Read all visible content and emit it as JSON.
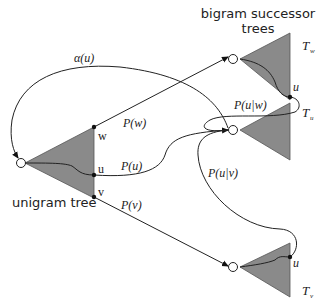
{
  "diagram": {
    "labels": {
      "unigram_tree": "unigram tree",
      "bigram_title_line1": "bigram successor",
      "bigram_title_line2": "trees",
      "alpha": "α(u)",
      "p_w": "P(w)",
      "p_u": "P(u)",
      "p_v": "P(v)",
      "p_u_given_w": "P(u|w)",
      "p_u_given_v": "P(u|v)",
      "leaf_w": "w",
      "leaf_u": "u",
      "leaf_v": "v",
      "tw_leaf_u": "u",
      "tv_leaf_u": "u",
      "t_w_main": "T",
      "t_w_sub": "w",
      "t_u_main": "T",
      "t_u_sub": "u",
      "t_v_main": "T",
      "t_v_sub": "v"
    },
    "nodes": [
      {
        "id": "unigram-root",
        "label": "unigram tree"
      },
      {
        "id": "Tw-root",
        "label": "T_w"
      },
      {
        "id": "Tu-root",
        "label": "T_u"
      },
      {
        "id": "Tv-root",
        "label": "T_v"
      }
    ],
    "edges": [
      {
        "from": "unigram.w",
        "to": "Tw-root",
        "label": "P(w)"
      },
      {
        "from": "unigram.u",
        "to": "Tu-root",
        "label": "P(u)"
      },
      {
        "from": "unigram.v",
        "to": "Tv-root",
        "label": "P(v)"
      },
      {
        "from": "Tw.u",
        "to": "Tu-root",
        "label": "P(u|w)"
      },
      {
        "from": "Tv.u",
        "to": "Tu-root",
        "label": "P(u|v)"
      },
      {
        "from": "Tu-root",
        "to": "unigram-root",
        "label": "α(u)"
      }
    ],
    "colors": {
      "triangle_fill": "#8a8a8a",
      "line": "#222222",
      "background": "#ffffff"
    }
  }
}
